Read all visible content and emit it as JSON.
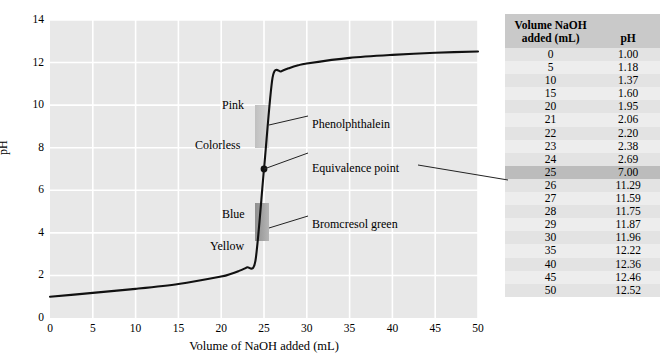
{
  "chart_data": {
    "type": "line",
    "title": "",
    "xlabel": "Volume of NaOH added (mL)",
    "ylabel": "pH",
    "xlim": [
      0,
      50
    ],
    "ylim": [
      0,
      14
    ],
    "xticks": [
      0,
      5,
      10,
      15,
      20,
      25,
      30,
      35,
      40,
      45,
      50
    ],
    "yticks": [
      0,
      2,
      4,
      6,
      8,
      10,
      12,
      14
    ],
    "grid": true,
    "legend": "none",
    "x": [
      0,
      5,
      10,
      15,
      20,
      21,
      22,
      23,
      24,
      25,
      26,
      27,
      28,
      29,
      30,
      35,
      40,
      45,
      50
    ],
    "values": [
      1.0,
      1.18,
      1.37,
      1.6,
      1.95,
      2.06,
      2.2,
      2.38,
      2.69,
      7.0,
      11.29,
      11.59,
      11.75,
      11.87,
      11.96,
      12.22,
      12.36,
      12.46,
      12.52
    ],
    "annotations": [
      {
        "name": "equivalence-point",
        "label": "Equivalence point",
        "x": 25,
        "y": 7.0
      },
      {
        "name": "phenolphthalein",
        "label": "Phenolphthalein",
        "range_low": 8.3,
        "range_high": 10.0
      },
      {
        "name": "bromcresol-green",
        "label": "Bromcresol green",
        "range_low": 3.8,
        "range_high": 5.4
      },
      {
        "name": "color-pink",
        "label": "Pink"
      },
      {
        "name": "color-colorless",
        "label": "Colorless"
      },
      {
        "name": "color-blue",
        "label": "Blue"
      },
      {
        "name": "color-yellow",
        "label": "Yellow"
      }
    ],
    "colors": {
      "plot_background": "#e8e8e8",
      "gridline": "#ffffff",
      "curve": "#111111",
      "band_phenolphthalein": "#c4c4c4",
      "band_bromcresol": "#9a9a9a",
      "table_header": "#c9c9c9",
      "table_highlight": "#bcbcbc"
    }
  },
  "axes": {
    "x_title": "Volume of NaOH added (mL)",
    "y_title": "pH",
    "x_tick_labels": [
      "0",
      "5",
      "10",
      "15",
      "20",
      "25",
      "30",
      "35",
      "40",
      "45",
      "50"
    ],
    "y_tick_labels": [
      "0",
      "2",
      "4",
      "6",
      "8",
      "10",
      "12",
      "14"
    ]
  },
  "annotations": {
    "equivalence_point": "Equivalence point",
    "phenolphthalein": "Phenolphthalein",
    "bromcresol_green": "Bromcresol green",
    "pink": "Pink",
    "colorless": "Colorless",
    "blue": "Blue",
    "yellow": "Yellow"
  },
  "table": {
    "headers": [
      "Volume NaOH added (mL)",
      "pH"
    ],
    "header_line1": "Volume NaOH",
    "header_line2": "added (mL)",
    "header_ph": "pH",
    "rows": [
      {
        "volume": "0",
        "ph": "1.00",
        "highlight": false
      },
      {
        "volume": "5",
        "ph": "1.18",
        "highlight": false
      },
      {
        "volume": "10",
        "ph": "1.37",
        "highlight": false
      },
      {
        "volume": "15",
        "ph": "1.60",
        "highlight": false
      },
      {
        "volume": "20",
        "ph": "1.95",
        "highlight": false
      },
      {
        "volume": "21",
        "ph": "2.06",
        "highlight": false
      },
      {
        "volume": "22",
        "ph": "2.20",
        "highlight": false
      },
      {
        "volume": "23",
        "ph": "2.38",
        "highlight": false
      },
      {
        "volume": "24",
        "ph": "2.69",
        "highlight": false
      },
      {
        "volume": "25",
        "ph": "7.00",
        "highlight": true
      },
      {
        "volume": "26",
        "ph": "11.29",
        "highlight": false
      },
      {
        "volume": "27",
        "ph": "11.59",
        "highlight": false
      },
      {
        "volume": "28",
        "ph": "11.75",
        "highlight": false
      },
      {
        "volume": "29",
        "ph": "11.87",
        "highlight": false
      },
      {
        "volume": "30",
        "ph": "11.96",
        "highlight": false
      },
      {
        "volume": "35",
        "ph": "12.22",
        "highlight": false
      },
      {
        "volume": "40",
        "ph": "12.36",
        "highlight": false
      },
      {
        "volume": "45",
        "ph": "12.46",
        "highlight": false
      },
      {
        "volume": "50",
        "ph": "12.52",
        "highlight": false
      }
    ]
  }
}
